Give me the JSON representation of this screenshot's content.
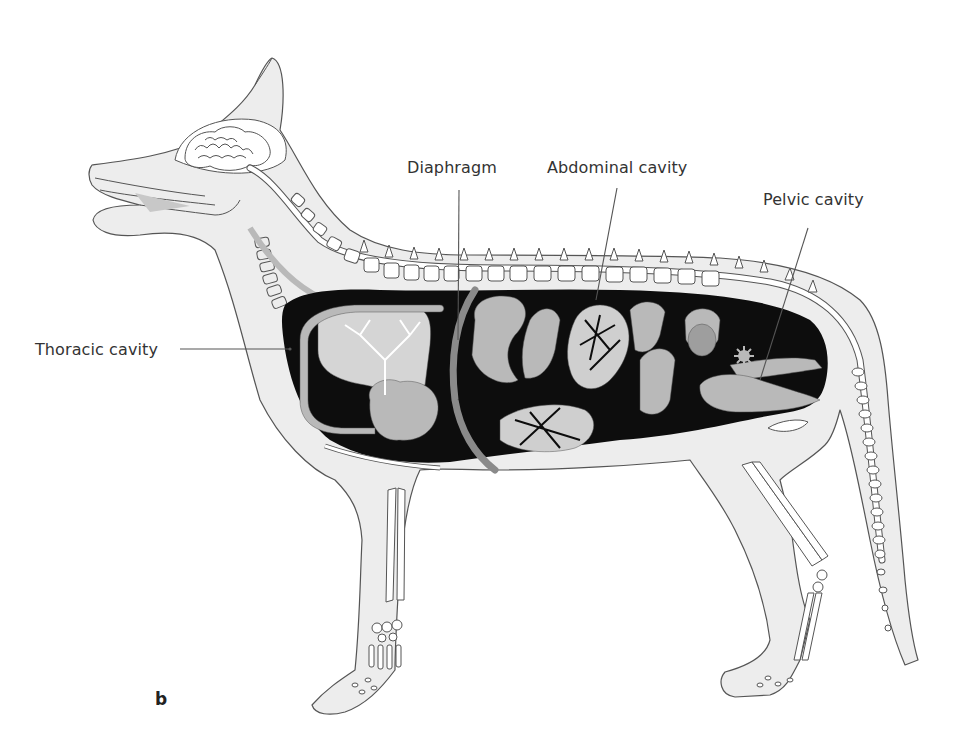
{
  "figure": {
    "panel_letter": "b",
    "colors": {
      "body_fill": "#ededed",
      "outline": "#555555",
      "cavity": "#0d0d0d",
      "organ": "#b9b9b9",
      "diaphragm": "#8a8a8a",
      "bone": "#ffffff",
      "label_text": "#333333",
      "leader_line": "#555555"
    },
    "labels": [
      {
        "id": "diaphragm",
        "text": "Diaphragm",
        "x": 407,
        "y": 158
      },
      {
        "id": "abdominal",
        "text": "Abdominal cavity",
        "x": 547,
        "y": 158
      },
      {
        "id": "pelvic",
        "text": "Pelvic cavity",
        "x": 763,
        "y": 190
      },
      {
        "id": "thoracic",
        "text": "Thoracic cavity",
        "x": 35,
        "y": 340
      }
    ]
  }
}
